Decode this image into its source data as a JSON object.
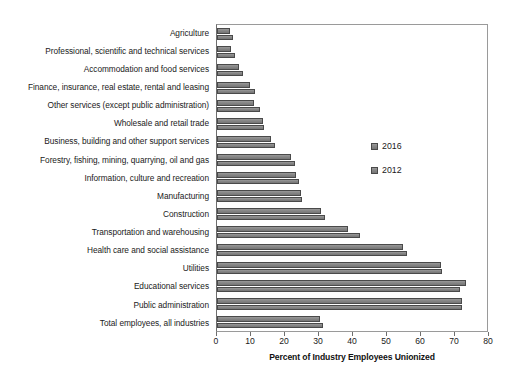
{
  "chart_data": {
    "type": "bar",
    "orientation": "horizontal",
    "title": "",
    "xlabel": "Percent of Industry Employees Unionized",
    "ylabel": "",
    "xlim": [
      0,
      80
    ],
    "xticks": [
      0,
      10,
      20,
      30,
      40,
      50,
      60,
      70,
      80
    ],
    "grid": false,
    "legend_position": "center-right",
    "categories": [
      "Agriculture",
      "Professional, scientific and technical services",
      "Accommodation and food services",
      "Finance, insurance, real estate, rental and leasing",
      "Other services (except public administration)",
      "Wholesale and retail trade",
      "Business, building and other support services",
      "Forestry, fishing, mining, quarrying, oil and gas",
      "Information, culture and recreation",
      "Manufacturing",
      "Construction",
      "Transportation and warehousing",
      "Health care and social assistance",
      "Utilities",
      "Educational services",
      "Public administration",
      "Total employees, all industries"
    ],
    "series": [
      {
        "name": "2016",
        "color": "#8a8a8a",
        "values": [
          3.9,
          4.2,
          6.4,
          9.6,
          10.9,
          13.5,
          15.9,
          21.9,
          23.3,
          24.6,
          30.6,
          38.5,
          54.8,
          66.0,
          73.2,
          72.0,
          30.3
        ]
      },
      {
        "name": "2012",
        "color": "#8a8a8a",
        "values": [
          4.6,
          5.2,
          7.6,
          11.2,
          12.5,
          13.9,
          17.1,
          22.9,
          24.1,
          25.0,
          31.9,
          42.0,
          56.0,
          66.1,
          71.6,
          72.2,
          31.3
        ]
      }
    ]
  },
  "legend": {
    "items": [
      {
        "label": "2016"
      },
      {
        "label": "2012"
      }
    ]
  },
  "axis": {
    "x_title": "Percent of Industry Employees Unionized",
    "tick_labels": [
      "0",
      "10",
      "20",
      "30",
      "40",
      "50",
      "60",
      "70",
      "80"
    ]
  }
}
